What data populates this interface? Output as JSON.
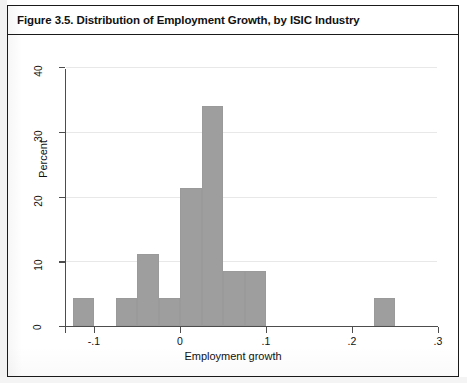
{
  "figure": {
    "title": "Figure 3.5. Distribution of Employment Growth, by ISIC Industry"
  },
  "chart_data": {
    "type": "bar",
    "subtype": "histogram",
    "title": "Figure 3.5. Distribution of Employment Growth, by ISIC Industry",
    "xlabel": "Employment growth",
    "ylabel": "Percent",
    "xlim": [
      -0.15,
      0.305
    ],
    "ylim": [
      0,
      42
    ],
    "xticks": [
      -0.1,
      0,
      0.1,
      0.2,
      0.3
    ],
    "xtick_labels": [
      "-.1",
      "0",
      ".1",
      ".2",
      ".3"
    ],
    "yticks": [
      0,
      10,
      20,
      30,
      40
    ],
    "ytick_labels": [
      "0",
      "10",
      "20",
      "30",
      "40"
    ],
    "grid": "horizontal",
    "legend": "none",
    "bin_width": 0.025,
    "bar_color": "#9e9e9e",
    "bins": [
      {
        "x_left": -0.125,
        "x_right": -0.1,
        "value": 4.3
      },
      {
        "x_left": -0.075,
        "x_right": -0.05,
        "value": 4.3
      },
      {
        "x_left": -0.05,
        "x_right": -0.025,
        "value": 11.1
      },
      {
        "x_left": -0.025,
        "x_right": 0.0,
        "value": 4.3
      },
      {
        "x_left": 0.0,
        "x_right": 0.025,
        "value": 21.3
      },
      {
        "x_left": 0.025,
        "x_right": 0.05,
        "value": 34.0
      },
      {
        "x_left": 0.05,
        "x_right": 0.075,
        "value": 8.5
      },
      {
        "x_left": 0.075,
        "x_right": 0.1,
        "value": 8.5
      },
      {
        "x_left": 0.225,
        "x_right": 0.25,
        "value": 4.3
      }
    ]
  }
}
